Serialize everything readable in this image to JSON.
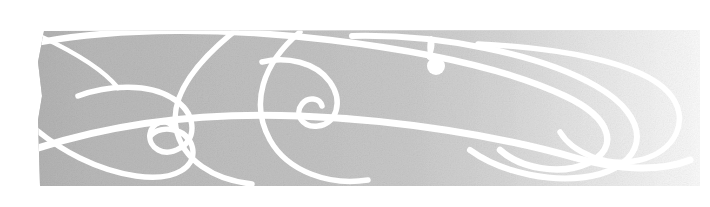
{
  "banner": {
    "title": "Decorative calligraphic flourish banner",
    "alt_text": "Horizontal gray gradient band overlaid with white swirling calligraphic flourishes",
    "canvas": {
      "width": 710,
      "height": 207,
      "background_color": "#ffffff"
    },
    "band": {
      "name": "gradient-band",
      "x": 38,
      "y": 30,
      "width": 662,
      "height": 157,
      "gradient_start_color": "#b6b6b6",
      "gradient_mid_color": "#c4c4c4",
      "gradient_end_color": "#fbfbfb",
      "gradient_direction": "left-to-right",
      "texture": "noise-grain"
    },
    "flourish": {
      "name": "white-swirl-ornament",
      "stroke_color": "#ffffff",
      "stroke_widths": [
        7,
        6,
        5,
        4
      ],
      "element_count": 11,
      "accent_dot": {
        "name": "teardrop-dot",
        "cx": 436,
        "cy": 66,
        "r": 9,
        "color": "#ffffff"
      }
    }
  }
}
